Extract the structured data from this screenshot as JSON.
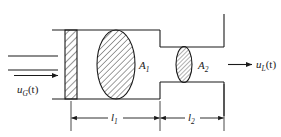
{
  "figure": {
    "type": "engineering-schematic",
    "background_color": "#ffffff",
    "line_color": "#1a1a1a"
  },
  "labels": {
    "inlet_flow": "u",
    "inlet_flow_sub": "G",
    "inlet_flow_arg": "(t)",
    "outlet_flow": "u",
    "outlet_flow_sub": "L",
    "outlet_flow_arg": "(t)",
    "area_1": "A",
    "area_1_sub": "1",
    "area_2": "A",
    "area_2_sub": "2",
    "length_1": "l",
    "length_1_sub": "1",
    "length_2": "l",
    "length_2_sub": "2"
  },
  "components": {
    "left_wall": {
      "name": "hatched-end-plate",
      "hatch": "diagonal"
    },
    "orifice_1": {
      "name": "large-hatched-ellipse",
      "label": "A1",
      "hatch": "diagonal"
    },
    "orifice_2": {
      "name": "small-hatched-ellipse",
      "label": "A2",
      "hatch": "diagonal"
    },
    "duct_section_1": {
      "name": "wide-duct",
      "length_label": "l1"
    },
    "duct_section_2": {
      "name": "narrow-duct",
      "length_label": "l2"
    }
  },
  "dimensions": {
    "segment_1_label": "l1",
    "segment_2_label": "l2"
  }
}
